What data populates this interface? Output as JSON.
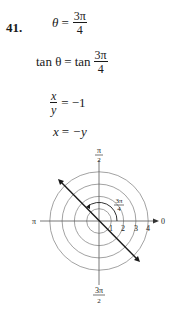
{
  "problem": {
    "number": "41.",
    "steps": [
      {
        "lhs": "θ",
        "rel": "=",
        "rhs_num": "3π",
        "rhs_den": "4"
      },
      {
        "lhs": "tan θ",
        "rel": "=",
        "rhs_prefix": "tan",
        "rhs_num": "3π",
        "rhs_den": "4"
      },
      {
        "lhs_num": "x",
        "lhs_den": "y",
        "rel": "=",
        "rhs": "−1"
      },
      {
        "lhs": "x",
        "rel": "=",
        "rhs": "−y"
      }
    ]
  },
  "graph": {
    "type": "polar-grid",
    "top_label_num": "π",
    "top_label_den": "2",
    "bottom_label_num": "3π",
    "bottom_label_den": "2",
    "left_label": "π",
    "right_label": "0",
    "angle_label_num": "3π",
    "angle_label_den": "4",
    "tick_labels": [
      "1",
      "2",
      "3",
      "4"
    ],
    "line_color": "#1a1a1a",
    "circle_color": "#8a8a8a"
  }
}
